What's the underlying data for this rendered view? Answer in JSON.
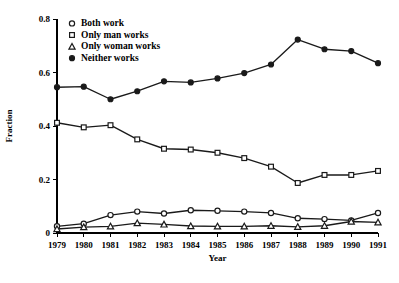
{
  "chart_data": {
    "type": "line",
    "title": "",
    "xlabel": "Year",
    "ylabel": "Fraction",
    "x": [
      1979,
      1980,
      1981,
      1982,
      1983,
      1984,
      1985,
      1986,
      1987,
      1988,
      1989,
      1990,
      1991
    ],
    "xtick_labels": [
      "1979",
      "1980",
      "1981",
      "1982",
      "1983",
      "1984",
      "1985",
      "1986",
      "1987",
      "1988",
      "1989",
      "1990",
      "1991"
    ],
    "ytick_labels": [
      "0",
      "0.2",
      "0.4",
      "0.6",
      "0.8"
    ],
    "ytick_values": [
      0,
      0.2,
      0.4,
      0.6,
      0.8
    ],
    "xlim": [
      1979,
      1991
    ],
    "ylim": [
      0,
      0.8
    ],
    "grid": false,
    "legend_position": "top-left inside",
    "series": [
      {
        "name": "Both work",
        "marker": "open-circle",
        "values": [
          0.025,
          0.035,
          0.067,
          0.08,
          0.073,
          0.085,
          0.083,
          0.08,
          0.075,
          0.055,
          0.052,
          0.047,
          0.075
        ]
      },
      {
        "name": "Only man works",
        "marker": "open-square",
        "values": [
          0.412,
          0.395,
          0.403,
          0.35,
          0.315,
          0.312,
          0.3,
          0.28,
          0.248,
          0.187,
          0.217,
          0.217,
          0.232
        ]
      },
      {
        "name": "Only woman works",
        "marker": "open-triangle",
        "values": [
          0.015,
          0.022,
          0.025,
          0.037,
          0.032,
          0.026,
          0.025,
          0.025,
          0.027,
          0.023,
          0.027,
          0.043,
          0.04
        ]
      },
      {
        "name": "Neither works",
        "marker": "filled-circle",
        "values": [
          0.545,
          0.547,
          0.5,
          0.53,
          0.567,
          0.563,
          0.578,
          0.598,
          0.63,
          0.723,
          0.687,
          0.68,
          0.635
        ]
      }
    ]
  },
  "legend": {
    "items": [
      {
        "label": "Both work",
        "marker": "open-circle"
      },
      {
        "label": "Only man works",
        "marker": "open-square"
      },
      {
        "label": "Only woman works",
        "marker": "open-triangle"
      },
      {
        "label": "Neither works",
        "marker": "filled-circle"
      }
    ]
  },
  "colors": {
    "ink": "#1a1a1a",
    "background": "#ffffff"
  }
}
